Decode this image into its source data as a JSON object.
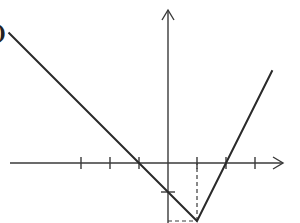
{
  "figure": {
    "clipped_label": ")"
  },
  "chart_data": {
    "type": "line",
    "title": "",
    "xlabel": "",
    "ylabel": "",
    "grid": false,
    "axes": {
      "x_arrow": true,
      "y_arrow": true
    },
    "x_ticks": [
      -3,
      -2,
      -1,
      1,
      2,
      3
    ],
    "y_ticks": [
      -1
    ],
    "tick_labels_shown": false,
    "series": [
      {
        "name": "f(x)",
        "points": [
          [
            -5.5,
            4.5
          ],
          [
            -1,
            0
          ],
          [
            1,
            -2
          ],
          [
            2,
            0
          ],
          [
            3.6,
            3.2
          ]
        ],
        "vertex": [
          1,
          -2
        ],
        "x_intercepts": [
          -1,
          2
        ],
        "y_intercept": -1
      }
    ],
    "guides": [
      {
        "type": "dashed-vertical",
        "x": 1,
        "from_y": -2,
        "to_y": 0
      },
      {
        "type": "dashed-horizontal",
        "y": -2,
        "from_x": 0,
        "to_x": 1
      }
    ],
    "colors": {
      "line": "#2a2a2a",
      "axis": "#3a3a3a",
      "background": "#ffffff"
    }
  },
  "geometry": {
    "origin_px": [
      168,
      163
    ],
    "unit_px": 29,
    "x_axis": {
      "x1": 10,
      "x2": 283
    },
    "y_axis": {
      "y1": 10,
      "y2": 223
    }
  }
}
